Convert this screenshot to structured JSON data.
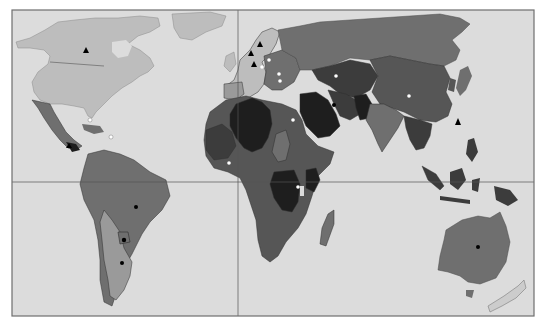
{
  "map": {
    "type": "world-choropleth-grayscale",
    "frame": {
      "x": 12,
      "y": 10,
      "width": 522,
      "height": 306
    },
    "reference_lines": {
      "equator_y": 182,
      "prime_meridian_x": 238
    },
    "colors": {
      "ocean": "#dcdcdc",
      "frame": "#6e6e6e",
      "grid_line": "#555555",
      "shade_lightest": "#bdbdbd",
      "shade_light": "#9a9a9a",
      "shade_mid": "#6f6f6f",
      "shade_dark": "#565656",
      "shade_darker": "#3c3c3c",
      "shade_darkest": "#1e1e1e",
      "border": "#2e2e2e",
      "marker_black": "#000000",
      "marker_white": "#ffffff"
    },
    "regions": [
      {
        "name": "north-america",
        "shade": "shade_lightest"
      },
      {
        "name": "greenland",
        "shade": "shade_lightest"
      },
      {
        "name": "mexico-central-america",
        "shade": "shade_mid"
      },
      {
        "name": "south-america",
        "shade": "shade_mid"
      },
      {
        "name": "argentina-chile",
        "shade": "shade_light"
      },
      {
        "name": "western-europe",
        "shade": "shade_lightest"
      },
      {
        "name": "eastern-europe",
        "shade": "shade_mid"
      },
      {
        "name": "russia",
        "shade": "shade_mid"
      },
      {
        "name": "north-africa",
        "shade": "shade_darkest"
      },
      {
        "name": "west-africa",
        "shade": "shade_dark"
      },
      {
        "name": "central-africa",
        "shade": "shade_darkest"
      },
      {
        "name": "southern-africa",
        "shade": "shade_dark"
      },
      {
        "name": "madagascar",
        "shade": "shade_mid"
      },
      {
        "name": "middle-east",
        "shade": "shade_darkest"
      },
      {
        "name": "central-asia",
        "shade": "shade_darker"
      },
      {
        "name": "south-asia",
        "shade": "shade_mid"
      },
      {
        "name": "china-mongolia",
        "shade": "shade_dark"
      },
      {
        "name": "southeast-asia",
        "shade": "shade_darker"
      },
      {
        "name": "indonesia-png",
        "shade": "shade_darker"
      },
      {
        "name": "japan",
        "shade": "shade_mid"
      },
      {
        "name": "australia",
        "shade": "shade_mid"
      },
      {
        "name": "new-zealand",
        "shade": "shade_lightest"
      }
    ],
    "markers": [
      {
        "type": "black-triangle",
        "x": 86,
        "y": 50
      },
      {
        "type": "white-dot",
        "x": 90,
        "y": 120
      },
      {
        "type": "white-dot",
        "x": 111,
        "y": 137
      },
      {
        "type": "black-triangle",
        "x": 69,
        "y": 145
      },
      {
        "type": "black-triangle",
        "x": 260,
        "y": 44
      },
      {
        "type": "black-triangle",
        "x": 251,
        "y": 53
      },
      {
        "type": "black-triangle",
        "x": 254,
        "y": 64
      },
      {
        "type": "white-dot",
        "x": 269,
        "y": 60
      },
      {
        "type": "white-dot",
        "x": 262,
        "y": 67
      },
      {
        "type": "white-dot",
        "x": 279,
        "y": 74
      },
      {
        "type": "white-dot",
        "x": 280,
        "y": 81
      },
      {
        "type": "white-dot",
        "x": 336,
        "y": 76
      },
      {
        "type": "black-dot",
        "x": 334,
        "y": 105
      },
      {
        "type": "white-dot",
        "x": 293,
        "y": 120
      },
      {
        "type": "white-dot",
        "x": 229,
        "y": 163
      },
      {
        "type": "white-dot",
        "x": 409,
        "y": 96
      },
      {
        "type": "black-triangle",
        "x": 458,
        "y": 122
      },
      {
        "type": "white-dot",
        "x": 298,
        "y": 187
      },
      {
        "type": "black-dot",
        "x": 136,
        "y": 207
      },
      {
        "type": "black-dot",
        "x": 124,
        "y": 240
      },
      {
        "type": "black-dot",
        "x": 122,
        "y": 263
      },
      {
        "type": "black-dot",
        "x": 478,
        "y": 247
      }
    ]
  }
}
